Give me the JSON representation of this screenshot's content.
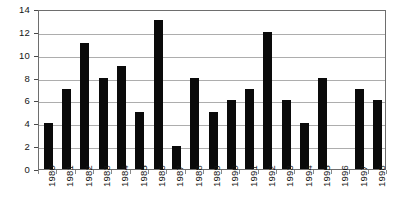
{
  "chart_data": {
    "type": "bar",
    "title": "",
    "subtitle": "",
    "xlabel": "",
    "ylabel": "",
    "categories": [
      "1980",
      "1981",
      "1982",
      "1983",
      "1984",
      "1985",
      "1986",
      "1987",
      "1988",
      "1989",
      "1990",
      "1991",
      "1992",
      "1993",
      "1994",
      "1995",
      "1996",
      "1997",
      "1998"
    ],
    "values": [
      4,
      7,
      11,
      8,
      9,
      5,
      13,
      2,
      8,
      5,
      6,
      7,
      12,
      6,
      4,
      8,
      0,
      7,
      6
    ],
    "ylim": [
      0,
      14
    ],
    "ytick_labels": [
      "14",
      "12",
      "10",
      "8",
      "6",
      "4",
      "2",
      "0"
    ],
    "ytick_values": [
      14,
      12,
      10,
      8,
      6,
      4,
      2,
      0
    ],
    "ytick_step": 2,
    "grid": true,
    "grid_axis": "y",
    "legend": false,
    "legend_position": "none",
    "annotations": [],
    "series": [
      {
        "name": "",
        "values": [
          4,
          7,
          11,
          8,
          9,
          5,
          13,
          2,
          8,
          5,
          6,
          7,
          12,
          6,
          4,
          8,
          0,
          7,
          6
        ]
      }
    ]
  },
  "style": {
    "bar_color": "#0a0a0a",
    "grid_color": "#adadad",
    "frame_color": "#6e6e6e",
    "text_color": "#151515",
    "background": "#ffffff"
  }
}
